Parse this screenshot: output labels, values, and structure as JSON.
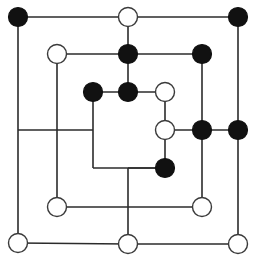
{
  "diagram": {
    "type": "graph",
    "width": 259,
    "height": 265,
    "background_color": "#ffffff",
    "edge_color": "#2b2b2b",
    "edge_width": 1.6,
    "node_fill_black": "#111111",
    "node_fill_white": "#ffffff",
    "node_stroke": "#3a3a3a",
    "node_radius_black": 9.5,
    "node_radius_white": 9.5,
    "legend": {
      "black_label": "filled node",
      "white_label": "open node"
    },
    "nodes": [
      {
        "id": "n1",
        "x": 18,
        "y": 17,
        "fill": "black",
        "label": "top-left-corner"
      },
      {
        "id": "n2",
        "x": 128,
        "y": 17,
        "fill": "white",
        "label": "top-center"
      },
      {
        "id": "n3",
        "x": 238,
        "y": 17,
        "fill": "black",
        "label": "top-right-corner"
      },
      {
        "id": "n4",
        "x": 57,
        "y": 54,
        "fill": "white",
        "label": "row2-left"
      },
      {
        "id": "n5",
        "x": 128,
        "y": 54,
        "fill": "black",
        "label": "row2-center"
      },
      {
        "id": "n6",
        "x": 202,
        "y": 54,
        "fill": "black",
        "label": "row2-right"
      },
      {
        "id": "n7",
        "x": 93,
        "y": 92,
        "fill": "black",
        "label": "row3-left"
      },
      {
        "id": "n8",
        "x": 128,
        "y": 92,
        "fill": "black",
        "label": "row3-center"
      },
      {
        "id": "n9",
        "x": 165,
        "y": 92,
        "fill": "white",
        "label": "row3-right"
      },
      {
        "id": "n10",
        "x": 165,
        "y": 130,
        "fill": "white",
        "label": "row4-inner"
      },
      {
        "id": "n11",
        "x": 202,
        "y": 130,
        "fill": "black",
        "label": "row4-right"
      },
      {
        "id": "n12",
        "x": 238,
        "y": 130,
        "fill": "black",
        "label": "row4-far-right"
      },
      {
        "id": "n13",
        "x": 165,
        "y": 168,
        "fill": "black",
        "label": "row5-center"
      },
      {
        "id": "n14",
        "x": 57,
        "y": 207,
        "fill": "white",
        "label": "row6-left"
      },
      {
        "id": "n15",
        "x": 202,
        "y": 207,
        "fill": "white",
        "label": "row6-right"
      },
      {
        "id": "n16",
        "x": 18,
        "y": 243,
        "fill": "white",
        "label": "bottom-left-corner"
      },
      {
        "id": "n17",
        "x": 128,
        "y": 244,
        "fill": "white",
        "label": "bottom-center"
      },
      {
        "id": "n18",
        "x": 238,
        "y": 244,
        "fill": "white",
        "label": "bottom-right-corner"
      }
    ],
    "edges": [
      {
        "id": "e1",
        "x1": 18,
        "y1": 17,
        "x2": 128,
        "y2": 17,
        "label": "top-left-to-top-center"
      },
      {
        "id": "e2",
        "x1": 128,
        "y1": 17,
        "x2": 238,
        "y2": 17,
        "label": "top-center-to-top-right"
      },
      {
        "id": "e3",
        "x1": 18,
        "y1": 17,
        "x2": 18,
        "y2": 243,
        "label": "left-outer-vertical"
      },
      {
        "id": "e4",
        "x1": 238,
        "y1": 17,
        "x2": 238,
        "y2": 130,
        "label": "right-outer-vertical-upper"
      },
      {
        "id": "e5",
        "x1": 238,
        "y1": 130,
        "x2": 238,
        "y2": 244,
        "label": "right-outer-vertical-lower"
      },
      {
        "id": "e6",
        "x1": 18,
        "y1": 243,
        "x2": 128,
        "y2": 244,
        "label": "bottom-left-to-bottom-center"
      },
      {
        "id": "e7",
        "x1": 128,
        "y1": 244,
        "x2": 238,
        "y2": 244,
        "label": "bottom-center-to-bottom-right"
      },
      {
        "id": "e8",
        "x1": 57,
        "y1": 54,
        "x2": 128,
        "y2": 54,
        "label": "row2-left-to-center"
      },
      {
        "id": "e9",
        "x1": 128,
        "y1": 54,
        "x2": 202,
        "y2": 54,
        "label": "row2-center-to-right"
      },
      {
        "id": "e10",
        "x1": 128,
        "y1": 17,
        "x2": 128,
        "y2": 54,
        "label": "center-col-r1-r2"
      },
      {
        "id": "e11",
        "x1": 128,
        "y1": 54,
        "x2": 128,
        "y2": 92,
        "label": "center-col-r2-r3"
      },
      {
        "id": "e12",
        "x1": 57,
        "y1": 54,
        "x2": 57,
        "y2": 207,
        "label": "left-inner-vertical"
      },
      {
        "id": "e13",
        "x1": 202,
        "y1": 54,
        "x2": 202,
        "y2": 130,
        "label": "right-inner-vertical-upper"
      },
      {
        "id": "e14",
        "x1": 202,
        "y1": 130,
        "x2": 202,
        "y2": 207,
        "label": "right-inner-vertical-lower"
      },
      {
        "id": "e15",
        "x1": 93,
        "y1": 92,
        "x2": 128,
        "y2": 92,
        "label": "row3-left-to-center"
      },
      {
        "id": "e16",
        "x1": 128,
        "y1": 92,
        "x2": 165,
        "y2": 92,
        "label": "row3-center-to-right"
      },
      {
        "id": "e17",
        "x1": 93,
        "y1": 92,
        "x2": 93,
        "y2": 168,
        "label": "inner-square-left"
      },
      {
        "id": "e18",
        "x1": 93,
        "y1": 168,
        "x2": 165,
        "y2": 168,
        "label": "inner-square-bottom"
      },
      {
        "id": "e19",
        "x1": 165,
        "y1": 92,
        "x2": 165,
        "y2": 130,
        "label": "inner-square-right-upper"
      },
      {
        "id": "e20",
        "x1": 165,
        "y1": 130,
        "x2": 165,
        "y2": 168,
        "label": "inner-square-right-lower"
      },
      {
        "id": "e21",
        "x1": 18,
        "y1": 130,
        "x2": 93,
        "y2": 130,
        "label": "mid-left-horizontal"
      },
      {
        "id": "e22",
        "x1": 165,
        "y1": 130,
        "x2": 202,
        "y2": 130,
        "label": "row4-inner-to-right"
      },
      {
        "id": "e23",
        "x1": 202,
        "y1": 130,
        "x2": 238,
        "y2": 130,
        "label": "row4-right-to-far-right"
      },
      {
        "id": "e24",
        "x1": 128,
        "y1": 168,
        "x2": 128,
        "y2": 244,
        "label": "center-col-lower"
      },
      {
        "id": "e25",
        "x1": 57,
        "y1": 207,
        "x2": 202,
        "y2": 207,
        "label": "row6-horizontal"
      },
      {
        "id": "e26",
        "x1": 165,
        "y1": 168,
        "x2": 128,
        "y2": 168,
        "label": "row5-center-to-center-col"
      }
    ]
  }
}
